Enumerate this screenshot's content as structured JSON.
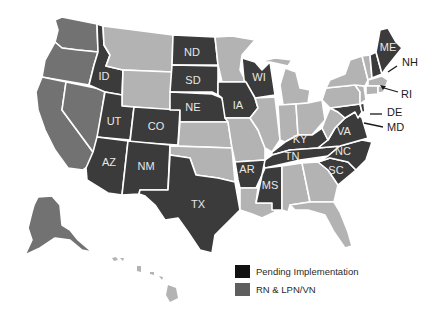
{
  "map": {
    "title": "",
    "colors": {
      "pending": "#3b3b3b",
      "rn_lpn_vn": "#727272",
      "none": "#b3b3b3",
      "border": "#ffffff"
    },
    "state_labels": {
      "ND": "ND",
      "SD": "SD",
      "NE": "NE",
      "ID": "ID",
      "UT": "UT",
      "CO": "CO",
      "AZ": "AZ",
      "NM": "NM",
      "TX": "TX",
      "IA": "IA",
      "WI": "WI",
      "AR": "AR",
      "MS": "MS",
      "TN": "TN",
      "KY": "KY",
      "VA": "VA",
      "NC": "NC",
      "SC": "SC",
      "ME": "ME",
      "NH": "NH",
      "RI": "RI",
      "DE": "DE",
      "MD": "MD"
    },
    "states": {
      "pending": [
        "ME",
        "NH",
        "WI",
        "IA",
        "ND",
        "SD",
        "NE",
        "ID",
        "UT",
        "CO",
        "AZ",
        "NM",
        "TX",
        "AR",
        "MS",
        "TN",
        "KY",
        "VA",
        "NC",
        "SC",
        "MD",
        "DE"
      ],
      "rn_lpn_vn": [
        "WA",
        "OR",
        "CA",
        "NV",
        "AK"
      ],
      "none": [
        "MT",
        "WY",
        "KS",
        "OK",
        "MN",
        "MO",
        "IL",
        "MI",
        "IN",
        "OH",
        "PA",
        "NY",
        "VT",
        "MA",
        "CT",
        "RI",
        "NJ",
        "WV",
        "LA",
        "AL",
        "GA",
        "FL",
        "HI"
      ]
    }
  },
  "legend": {
    "items": [
      {
        "label": "Pending Implementation",
        "color": "#111111"
      },
      {
        "label": "RN & LPN/VN",
        "color": "#5e5e5e"
      }
    ]
  }
}
